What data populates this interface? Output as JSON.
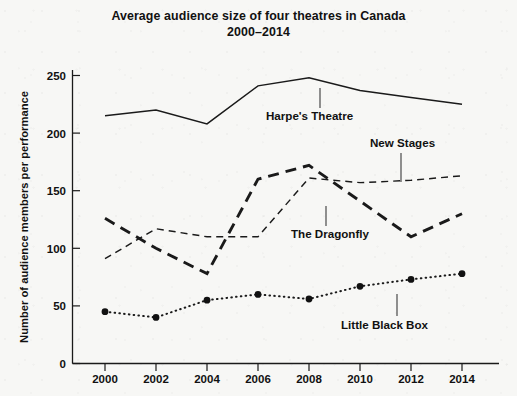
{
  "chart_data": {
    "type": "line",
    "title": "Average audience size of four theatres in Canada",
    "subtitle": "2000–2014",
    "xlabel": "",
    "ylabel": "Number of audience members per performance",
    "categories": [
      "2000",
      "2002",
      "2004",
      "2006",
      "2008",
      "2010",
      "2012",
      "2014"
    ],
    "x": [
      2000,
      2002,
      2004,
      2006,
      2008,
      2010,
      2012,
      2014
    ],
    "xlim": [
      1999,
      2015
    ],
    "ylim": [
      0,
      250
    ],
    "yticks": [
      0,
      50,
      100,
      150,
      200,
      250
    ],
    "xticks": [
      "2000",
      "2002",
      "2004",
      "2006",
      "2008",
      "2010",
      "2012",
      "2014"
    ],
    "grid": false,
    "legend": "inline-annotations",
    "series": [
      {
        "name": "Harpe's Theatre",
        "style": "solid",
        "markers": false,
        "values": [
          215,
          220,
          208,
          241,
          248,
          237,
          231,
          225
        ]
      },
      {
        "name": "The Dragonfly",
        "style": "thick-dashed",
        "markers": false,
        "values": [
          126,
          100,
          78,
          160,
          172,
          141,
          110,
          130
        ]
      },
      {
        "name": "New Stages",
        "style": "thin-dashed",
        "markers": false,
        "values": [
          91,
          117,
          110,
          110,
          161,
          157,
          159,
          163
        ]
      },
      {
        "name": "Little Black Box",
        "style": "dotted",
        "markers": true,
        "values": [
          45,
          40,
          55,
          60,
          56,
          67,
          73,
          78
        ]
      }
    ],
    "annotations": [
      {
        "name": "Harpe's Theatre",
        "text": "Harpe's Theatre",
        "x": 287,
        "y": 116,
        "leader": true
      },
      {
        "name": "New Stages",
        "text": "New Stages",
        "x": 375,
        "y": 147,
        "leader": true
      },
      {
        "name": "The Dragonfly",
        "text": "The Dragonfly",
        "x": 291,
        "y": 234,
        "leader": true
      },
      {
        "name": "Little Black Box",
        "text": "Little Black Box",
        "x": 345,
        "y": 325,
        "leader": true
      }
    ],
    "colors": {
      "ink": "#111111",
      "background": "#f7f7f5",
      "axis": "#1a1a1a"
    }
  }
}
